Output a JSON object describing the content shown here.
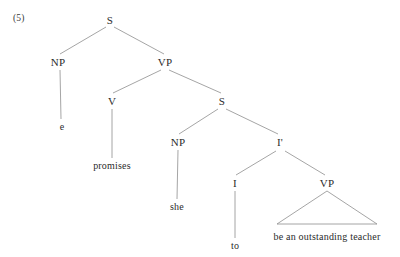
{
  "figure": {
    "example_number": "(5)",
    "background_color": "#ffffff",
    "line_color": "#8e8e8e",
    "text_color": "#2b2b2b",
    "width": 400,
    "height": 257
  },
  "tree": {
    "nodes": [
      {
        "id": "s-root",
        "label": "S",
        "x": 110,
        "y": 20,
        "type": "category"
      },
      {
        "id": "np-matrix",
        "label": "NP",
        "x": 58,
        "y": 62,
        "type": "category"
      },
      {
        "id": "vp-matrix",
        "label": "VP",
        "x": 165,
        "y": 62,
        "type": "category"
      },
      {
        "id": "v-matrix",
        "label": "V",
        "x": 112,
        "y": 101,
        "type": "category"
      },
      {
        "id": "s-embedded",
        "label": "S",
        "x": 222,
        "y": 101,
        "type": "category"
      },
      {
        "id": "np-embedded",
        "label": "NP",
        "x": 178,
        "y": 142,
        "type": "category"
      },
      {
        "id": "i-bar",
        "label": "I'",
        "x": 280,
        "y": 142,
        "type": "category"
      },
      {
        "id": "i-head",
        "label": "I",
        "x": 235,
        "y": 183,
        "type": "category"
      },
      {
        "id": "vp-embedded",
        "label": "VP",
        "x": 327,
        "y": 183,
        "type": "category"
      }
    ],
    "leaves": [
      {
        "id": "leaf-e",
        "label": "e",
        "x": 62,
        "y": 126,
        "parent": "np-matrix"
      },
      {
        "id": "leaf-promises",
        "label": "promises",
        "x": 112,
        "y": 165,
        "parent": "v-matrix"
      },
      {
        "id": "leaf-she",
        "label": "she",
        "x": 177,
        "y": 206,
        "parent": "np-embedded"
      },
      {
        "id": "leaf-to",
        "label": "to",
        "x": 235,
        "y": 245,
        "parent": "i-head"
      },
      {
        "id": "leaf-vp-phrase",
        "label": "be an outstanding teacher",
        "x": 327,
        "y": 236,
        "parent": "vp-embedded"
      }
    ],
    "branches": [
      {
        "from": "s-root",
        "to": "np-matrix",
        "x1": 106,
        "y1": 27,
        "x2": 60,
        "y2": 54
      },
      {
        "from": "s-root",
        "to": "vp-matrix",
        "x1": 114,
        "y1": 27,
        "x2": 164,
        "y2": 54
      },
      {
        "from": "np-matrix",
        "to": "leaf-e",
        "x1": 60,
        "y1": 70,
        "x2": 61,
        "y2": 119
      },
      {
        "from": "vp-matrix",
        "to": "v-matrix",
        "x1": 161,
        "y1": 70,
        "x2": 113,
        "y2": 93
      },
      {
        "from": "vp-matrix",
        "to": "s-embedded",
        "x1": 169,
        "y1": 70,
        "x2": 221,
        "y2": 93
      },
      {
        "from": "v-matrix",
        "to": "leaf-promises",
        "x1": 112,
        "y1": 109,
        "x2": 112,
        "y2": 158
      },
      {
        "from": "s-embedded",
        "to": "np-embedded",
        "x1": 218,
        "y1": 109,
        "x2": 179,
        "y2": 134
      },
      {
        "from": "s-embedded",
        "to": "i-bar",
        "x1": 226,
        "y1": 109,
        "x2": 278,
        "y2": 134
      },
      {
        "from": "np-embedded",
        "to": "leaf-she",
        "x1": 178,
        "y1": 150,
        "x2": 177,
        "y2": 199
      },
      {
        "from": "i-bar",
        "to": "i-head",
        "x1": 276,
        "y1": 151,
        "x2": 236,
        "y2": 175
      },
      {
        "from": "i-bar",
        "to": "vp-embedded",
        "x1": 285,
        "y1": 151,
        "x2": 325,
        "y2": 175
      },
      {
        "from": "i-head",
        "to": "leaf-to",
        "x1": 235,
        "y1": 191,
        "x2": 235,
        "y2": 238
      }
    ],
    "triangles": [
      {
        "id": "vp-triangle",
        "parent": "vp-embedded",
        "apex_x": 327,
        "apex_y": 191,
        "base_left_x": 277,
        "base_right_x": 377,
        "base_y": 224,
        "covers": "be an outstanding teacher"
      }
    ]
  }
}
